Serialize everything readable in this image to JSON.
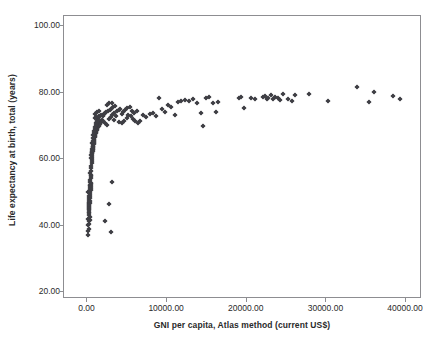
{
  "chart_data": {
    "type": "scatter",
    "title": "",
    "xlabel": "GNI per capita, Atlas method (current US$)",
    "ylabel": "Life expectancy at birth, total (years)",
    "xlim": [
      -2950,
      42000
    ],
    "ylim": [
      18,
      103
    ],
    "xticks": [
      0,
      10000,
      20000,
      30000,
      40000
    ],
    "xtick_labels": [
      "0.00",
      "10000.00",
      "20000.00",
      "30000.00",
      "40000.00"
    ],
    "yticks": [
      20,
      40,
      60,
      80,
      100
    ],
    "ytick_labels": [
      "20.00",
      "40.00",
      "60.00",
      "80.00",
      "100.00"
    ],
    "grid": false,
    "legend": null,
    "marker_color": "#3f3f45",
    "marker": "diamond",
    "frame_color": "#8d8d91",
    "background": "#ffffff",
    "points": [
      [
        90,
        37.2
      ],
      [
        110,
        38.4
      ],
      [
        120,
        40.1
      ],
      [
        130,
        41.3
      ],
      [
        95,
        42.0
      ],
      [
        140,
        43.2
      ],
      [
        160,
        44.6
      ],
      [
        150,
        45.3
      ],
      [
        170,
        45.9
      ],
      [
        180,
        46.4
      ],
      [
        190,
        46.8
      ],
      [
        200,
        47.2
      ],
      [
        210,
        47.8
      ],
      [
        230,
        48.4
      ],
      [
        250,
        49.0
      ],
      [
        120,
        50.2
      ],
      [
        260,
        50.8
      ],
      [
        280,
        51.4
      ],
      [
        300,
        51.9
      ],
      [
        320,
        52.3
      ],
      [
        340,
        53.0
      ],
      [
        360,
        53.6
      ],
      [
        380,
        54.2
      ],
      [
        400,
        54.8
      ],
      [
        420,
        55.3
      ],
      [
        300,
        55.9
      ],
      [
        440,
        56.4
      ],
      [
        470,
        57.2
      ],
      [
        500,
        58.0
      ],
      [
        520,
        58.7
      ],
      [
        160,
        43.8
      ],
      [
        180,
        44.2
      ],
      [
        200,
        44.9
      ],
      [
        220,
        45.6
      ],
      [
        240,
        46.2
      ],
      [
        260,
        46.9
      ],
      [
        280,
        47.5
      ],
      [
        310,
        48.2
      ],
      [
        330,
        48.9
      ],
      [
        350,
        49.5
      ],
      [
        370,
        50.1
      ],
      [
        390,
        50.7
      ],
      [
        410,
        51.3
      ],
      [
        430,
        51.8
      ],
      [
        450,
        52.4
      ],
      [
        470,
        52.9
      ],
      [
        200,
        38.9
      ],
      [
        240,
        40.4
      ],
      [
        280,
        41.8
      ],
      [
        310,
        42.6
      ],
      [
        540,
        59.4
      ],
      [
        560,
        60.1
      ],
      [
        580,
        60.8
      ],
      [
        600,
        61.4
      ],
      [
        620,
        62.0
      ],
      [
        650,
        62.6
      ],
      [
        680,
        63.1
      ],
      [
        700,
        63.6
      ],
      [
        720,
        64.1
      ],
      [
        750,
        64.6
      ],
      [
        780,
        65.0
      ],
      [
        800,
        65.4
      ],
      [
        830,
        65.8
      ],
      [
        860,
        66.2
      ],
      [
        890,
        66.6
      ],
      [
        920,
        67.0
      ],
      [
        950,
        67.3
      ],
      [
        980,
        67.6
      ],
      [
        1010,
        67.9
      ],
      [
        1050,
        68.2
      ],
      [
        1100,
        68.5
      ],
      [
        1150,
        68.8
      ],
      [
        1200,
        69.1
      ],
      [
        1250,
        69.4
      ],
      [
        1300,
        69.6
      ],
      [
        1350,
        69.9
      ],
      [
        1400,
        70.1
      ],
      [
        1450,
        70.3
      ],
      [
        1500,
        70.5
      ],
      [
        1550,
        70.7
      ],
      [
        1600,
        70.9
      ],
      [
        1650,
        71.1
      ],
      [
        1700,
        71.3
      ],
      [
        1750,
        71.5
      ],
      [
        1800,
        71.7
      ],
      [
        600,
        64.8
      ],
      [
        640,
        65.6
      ],
      [
        690,
        66.4
      ],
      [
        740,
        67.2
      ],
      [
        790,
        68.0
      ],
      [
        840,
        68.6
      ],
      [
        900,
        69.2
      ],
      [
        960,
        69.8
      ],
      [
        1020,
        70.3
      ],
      [
        1080,
        70.8
      ],
      [
        1140,
        71.2
      ],
      [
        1220,
        71.6
      ],
      [
        1300,
        72.0
      ],
      [
        1380,
        72.3
      ],
      [
        1460,
        72.6
      ],
      [
        560,
        62.3
      ],
      [
        620,
        63.0
      ],
      [
        700,
        63.8
      ],
      [
        780,
        64.5
      ],
      [
        870,
        65.2
      ],
      [
        450,
        60.5
      ],
      [
        500,
        61.2
      ],
      [
        550,
        61.8
      ],
      [
        610,
        62.5
      ],
      [
        670,
        63.2
      ],
      [
        1900,
        72.9
      ],
      [
        2000,
        73.2
      ],
      [
        2100,
        73.5
      ],
      [
        2200,
        73.8
      ],
      [
        2350,
        74.1
      ],
      [
        1000,
        73.6
      ],
      [
        1200,
        74.2
      ],
      [
        1400,
        74.6
      ],
      [
        900,
        72.4
      ],
      [
        1100,
        72.8
      ],
      [
        1500,
        73.0
      ],
      [
        1700,
        73.4
      ],
      [
        1950,
        71.5
      ],
      [
        2250,
        70.9
      ],
      [
        2450,
        70.4
      ],
      [
        2600,
        74.4
      ],
      [
        2800,
        74.8
      ],
      [
        3000,
        75.2
      ],
      [
        3250,
        75.6
      ],
      [
        3500,
        76.0
      ],
      [
        2700,
        72.2
      ],
      [
        2900,
        72.8
      ],
      [
        3100,
        73.4
      ],
      [
        3300,
        71.8
      ],
      [
        3550,
        73.0
      ],
      [
        2450,
        76.4
      ],
      [
        2750,
        76.8
      ],
      [
        3050,
        77.0
      ],
      [
        3350,
        74.0
      ],
      [
        3700,
        74.4
      ],
      [
        3900,
        74.8
      ],
      [
        4100,
        75.0
      ],
      [
        4300,
        73.6
      ],
      [
        4500,
        74.2
      ],
      [
        4700,
        74.8
      ],
      [
        4000,
        71.2
      ],
      [
        4300,
        70.8
      ],
      [
        4600,
        71.6
      ],
      [
        4900,
        72.4
      ],
      [
        5100,
        73.2
      ],
      [
        5400,
        73.0
      ],
      [
        5700,
        72.0
      ],
      [
        6000,
        71.4
      ],
      [
        6300,
        71.0
      ],
      [
        6600,
        71.6
      ],
      [
        5000,
        75.4
      ],
      [
        5300,
        75.8
      ],
      [
        5600,
        74.6
      ],
      [
        5900,
        74.0
      ],
      [
        6200,
        74.4
      ],
      [
        3100,
        53.2
      ],
      [
        2700,
        46.5
      ],
      [
        2150,
        41.5
      ],
      [
        3000,
        38.2
      ],
      [
        7000,
        73.2
      ],
      [
        7400,
        72.8
      ],
      [
        7800,
        73.6
      ],
      [
        8200,
        74.0
      ],
      [
        8600,
        73.0
      ],
      [
        9000,
        78.4
      ],
      [
        9300,
        75.0
      ],
      [
        9700,
        74.2
      ],
      [
        10100,
        76.4
      ],
      [
        10500,
        75.6
      ],
      [
        11000,
        73.4
      ],
      [
        11400,
        77.2
      ],
      [
        11800,
        77.6
      ],
      [
        12200,
        77.8
      ],
      [
        12700,
        77.6
      ],
      [
        13200,
        78.2
      ],
      [
        13700,
        76.8
      ],
      [
        14200,
        74.0
      ],
      [
        14500,
        70.0
      ],
      [
        14900,
        78.4
      ],
      [
        15300,
        78.8
      ],
      [
        15800,
        76.8
      ],
      [
        16100,
        74.2
      ],
      [
        16400,
        77.2
      ],
      [
        19000,
        78.4
      ],
      [
        19300,
        78.8
      ],
      [
        19700,
        75.4
      ],
      [
        20500,
        78.4
      ],
      [
        21000,
        78.2
      ],
      [
        22000,
        78.6
      ],
      [
        22300,
        79.0
      ],
      [
        22500,
        78.2
      ],
      [
        22700,
        78.4
      ],
      [
        23000,
        79.2
      ],
      [
        23300,
        78.0
      ],
      [
        23600,
        78.8
      ],
      [
        23900,
        78.4
      ],
      [
        24200,
        77.8
      ],
      [
        24600,
        79.6
      ],
      [
        25200,
        78.0
      ],
      [
        25700,
        77.4
      ],
      [
        26100,
        79.4
      ],
      [
        27800,
        79.6
      ],
      [
        30200,
        77.4
      ],
      [
        33800,
        81.6
      ],
      [
        35400,
        77.2
      ],
      [
        36000,
        80.2
      ],
      [
        38400,
        79.0
      ],
      [
        39300,
        78.2
      ]
    ]
  }
}
